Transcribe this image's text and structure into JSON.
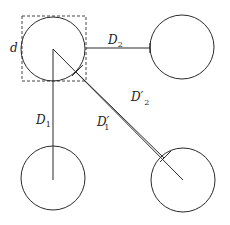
{
  "diagram": {
    "colors": {
      "stroke": "#2a2a2a",
      "dashed_box": "#444444",
      "background": "#ffffff"
    },
    "circles": [
      {
        "id": "top-left",
        "cx": 53,
        "cy": 49,
        "r": 32
      },
      {
        "id": "top-right",
        "cx": 182,
        "cy": 47,
        "r": 32
      },
      {
        "id": "bottom-left",
        "cx": 53,
        "cy": 178,
        "r": 32
      },
      {
        "id": "bottom-right",
        "cx": 183,
        "cy": 180,
        "r": 32
      }
    ],
    "bounding_box": {
      "x": 22,
      "y": 16,
      "width": 64,
      "height": 65,
      "style": "dashed"
    },
    "labels": {
      "d": {
        "text": "d",
        "x": 10,
        "y": 52
      },
      "D1": {
        "main": "D",
        "sub": "1",
        "x": 36,
        "y": 124
      },
      "D2": {
        "main": "D",
        "sub": "2",
        "x": 108,
        "y": 44
      },
      "D1_prime": {
        "main": "D′",
        "sub": "1",
        "x": 97,
        "y": 126
      },
      "D2_prime": {
        "main": "D′",
        "sub": "2",
        "x": 131,
        "y": 101
      }
    }
  }
}
